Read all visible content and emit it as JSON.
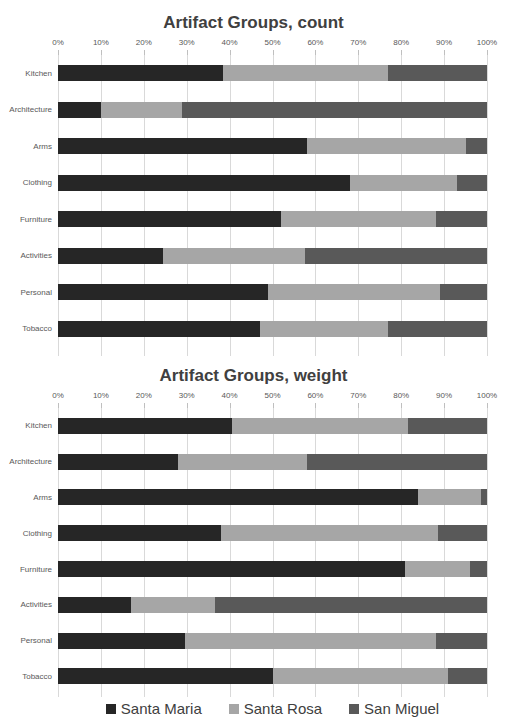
{
  "legend": {
    "items": [
      {
        "label": "Santa Maria",
        "color": "#262626"
      },
      {
        "label": "Santa Rosa",
        "color": "#a6a6a6"
      },
      {
        "label": "San Miguel",
        "color": "#595959"
      }
    ]
  },
  "chart_data": [
    {
      "type": "bar",
      "stacked": true,
      "orientation": "horizontal",
      "title": "Artifact Groups, count",
      "categories": [
        "Kitchen",
        "Architecture",
        "Arms",
        "Clothing",
        "Furniture",
        "Activities",
        "Personal",
        "Tobacco"
      ],
      "x_ticks": [
        "0%",
        "10%",
        "20%",
        "30%",
        "40%",
        "50%",
        "60%",
        "70%",
        "80%",
        "90%",
        "100%"
      ],
      "xlim": [
        0,
        100
      ],
      "grid": true,
      "series": [
        {
          "name": "Santa Maria",
          "color": "#262626",
          "values": [
            38.5,
            10,
            58,
            68,
            52,
            24.5,
            49,
            47
          ]
        },
        {
          "name": "Santa Rosa",
          "color": "#a6a6a6",
          "values": [
            38.5,
            19,
            37,
            25,
            36,
            33,
            40,
            30
          ]
        },
        {
          "name": "San Miguel",
          "color": "#595959",
          "values": [
            23,
            71,
            5,
            7,
            12,
            42.5,
            11,
            23
          ]
        }
      ]
    },
    {
      "type": "bar",
      "stacked": true,
      "orientation": "horizontal",
      "title": "Artifact Groups, weight",
      "categories": [
        "Kitchen",
        "Architecture",
        "Arms",
        "Clothing",
        "Furniture",
        "Activities",
        "Personal",
        "Tobacco"
      ],
      "x_ticks": [
        "0%",
        "10%",
        "20%",
        "30%",
        "40%",
        "50%",
        "60%",
        "70%",
        "80%",
        "90%",
        "100%"
      ],
      "xlim": [
        0,
        100
      ],
      "grid": true,
      "series": [
        {
          "name": "Santa Maria",
          "color": "#262626",
          "values": [
            40.5,
            28,
            84,
            38,
            81,
            17,
            29.5,
            50
          ]
        },
        {
          "name": "Santa Rosa",
          "color": "#a6a6a6",
          "values": [
            41,
            30,
            14.5,
            50.5,
            15,
            19.5,
            58.5,
            41
          ]
        },
        {
          "name": "San Miguel",
          "color": "#595959",
          "values": [
            18.5,
            42,
            1.5,
            11.5,
            4,
            63.5,
            12,
            9
          ]
        }
      ]
    }
  ]
}
